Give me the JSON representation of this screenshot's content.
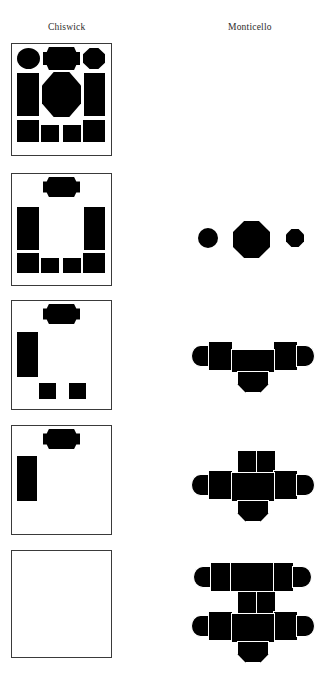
{
  "figure": {
    "background_color": "#ffffff",
    "ink_color": "#000000",
    "frame_color": "#3a3a3a",
    "columns": [
      {
        "id": "chiswick",
        "label": "Chiswick"
      },
      {
        "id": "monticello",
        "label": "Monticello"
      }
    ],
    "row_count": 5,
    "rows": [
      {
        "index": 1,
        "chiswick": {
          "framed": true,
          "description": "Complete plan: full octagonal central saloon flanked by rectangular rooms, circular and lozenge rooms along the top, four rectangular rooms along the bottom",
          "element_count": 11,
          "elements": [
            {
              "name": "circle-room-top-left",
              "shape": "circle"
            },
            {
              "name": "lozenge-room-top-center",
              "shape": "lozenge"
            },
            {
              "name": "octagon-room-top-right",
              "shape": "octagon"
            },
            {
              "name": "rect-room-left",
              "shape": "rectangle"
            },
            {
              "name": "octagon-saloon-center",
              "shape": "octagon"
            },
            {
              "name": "rect-room-right",
              "shape": "rectangle"
            },
            {
              "name": "rect-room-bottom-1",
              "shape": "rectangle"
            },
            {
              "name": "rect-room-bottom-2",
              "shape": "rectangle"
            },
            {
              "name": "rect-room-bottom-3",
              "shape": "rectangle"
            },
            {
              "name": "rect-room-bottom-4",
              "shape": "rectangle"
            }
          ]
        },
        "monticello": {
          "present": false,
          "description": "empty"
        }
      },
      {
        "index": 2,
        "chiswick": {
          "framed": true,
          "description": "Reduced plan: lozenge room at top center, two tall rectangles at left and right, four small rectangles along the bottom; central octagon removed",
          "element_count": 7
        },
        "monticello": {
          "present": true,
          "description": "Three detached volumes: small circle, central octagon, small octagon",
          "element_count": 3,
          "elements": [
            {
              "name": "circle-pavilion-left",
              "shape": "circle"
            },
            {
              "name": "octagon-core-center",
              "shape": "octagon"
            },
            {
              "name": "octagon-pavilion-right",
              "shape": "octagon"
            }
          ]
        }
      },
      {
        "index": 3,
        "chiswick": {
          "framed": true,
          "description": "Further reduced: lozenge room at top center, single tall rectangle at left, two small squares at bottom",
          "element_count": 4
        },
        "monticello": {
          "present": true,
          "description": "Linked massing: wing bays with rounded ends left and right, central block and apse below",
          "element_count": 8
        }
      },
      {
        "index": 4,
        "chiswick": {
          "framed": true,
          "description": "Minimal: lozenge room at top center and a single tall rectangle at left",
          "element_count": 2
        },
        "monticello": {
          "present": true,
          "description": "Grown massing: two upper rooms added above central block, wings with rounded ends, apse below",
          "element_count": 10
        }
      },
      {
        "index": 5,
        "chiswick": {
          "framed": true,
          "description": "Empty frame: all rooms removed",
          "element_count": 0
        },
        "monticello": {
          "present": true,
          "description": "Full massing: upper wing range with rounded ends, two upper rooms, lower wings with rounded ends, central block and apse",
          "element_count": 14
        }
      }
    ]
  }
}
